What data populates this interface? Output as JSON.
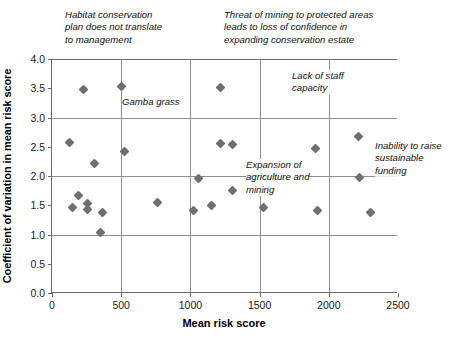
{
  "chart_data": {
    "type": "scatter",
    "title": "",
    "xlabel": "Mean risk score",
    "ylabel": "Coefficient of variation in mean risk score",
    "xlim": [
      0,
      2500
    ],
    "ylim": [
      0,
      4.0
    ],
    "xticks": [
      "0",
      "500",
      "1000",
      "1500",
      "2000",
      "2500"
    ],
    "xtick_values": [
      0,
      500,
      1000,
      1500,
      2000,
      2500
    ],
    "yticks": [
      "0.0",
      "0.5",
      "1.0",
      "1.5",
      "2.0",
      "2.5",
      "3.0",
      "3.5",
      "4.0"
    ],
    "ytick_values": [
      0.0,
      0.5,
      1.0,
      1.5,
      2.0,
      2.5,
      3.0,
      3.5,
      4.0
    ],
    "grid": "major gridlines at y = 1.0, 2.0, 3.0 and x = 500, 1000, 1500, 2000",
    "legend": "none",
    "marker": "filled grey diamond",
    "marker_color": "#6f6f6f",
    "points": [
      {
        "x": 130,
        "y": 2.57
      },
      {
        "x": 150,
        "y": 1.47
      },
      {
        "x": 190,
        "y": 1.66
      },
      {
        "x": 225,
        "y": 3.48
      },
      {
        "x": 255,
        "y": 1.53
      },
      {
        "x": 260,
        "y": 1.42
      },
      {
        "x": 305,
        "y": 2.21
      },
      {
        "x": 350,
        "y": 1.04
      },
      {
        "x": 365,
        "y": 1.37
      },
      {
        "x": 500,
        "y": 3.53
      },
      {
        "x": 525,
        "y": 2.42
      },
      {
        "x": 765,
        "y": 1.55
      },
      {
        "x": 1020,
        "y": 1.41
      },
      {
        "x": 1055,
        "y": 1.95
      },
      {
        "x": 1150,
        "y": 1.5
      },
      {
        "x": 1215,
        "y": 3.52
      },
      {
        "x": 1215,
        "y": 2.56
      },
      {
        "x": 1305,
        "y": 2.53
      },
      {
        "x": 1305,
        "y": 1.76
      },
      {
        "x": 1525,
        "y": 1.46
      },
      {
        "x": 1905,
        "y": 2.47
      },
      {
        "x": 1920,
        "y": 1.41
      },
      {
        "x": 2215,
        "y": 2.68
      },
      {
        "x": 2225,
        "y": 1.97
      },
      {
        "x": 2300,
        "y": 1.37
      }
    ],
    "annotations": [
      {
        "id": "habitat-conservation",
        "text": "Habitat conservation\nplan does not translate\nto management",
        "left_px": 65,
        "top_px": 9
      },
      {
        "id": "threat-of-mining",
        "text": "Threat of mining to protected areas\nleads to loss of confidence in\nexpanding conservation estate",
        "left_px": 224,
        "top_px": 9
      },
      {
        "id": "gamba-grass",
        "text": "Gamba grass",
        "left_px": 122,
        "top_px": 96
      },
      {
        "id": "lack-of-staff-capacity",
        "text": "Lack of staff\ncapacity",
        "left_px": 292,
        "top_px": 70
      },
      {
        "id": "expansion-of-agriculture",
        "text": "Expansion of\nagriculture and\nmining",
        "left_px": 246,
        "top_px": 159
      },
      {
        "id": "inability-to-raise-funding",
        "text": "Inability to raise\nsustainable\nfunding",
        "left_px": 375,
        "top_px": 140
      }
    ]
  }
}
